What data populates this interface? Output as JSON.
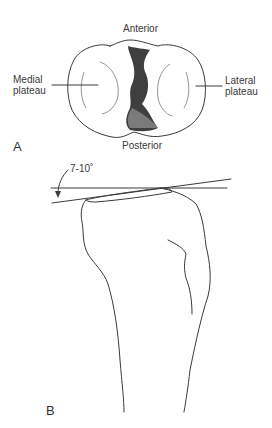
{
  "figure": {
    "panel_a": {
      "letter": "A",
      "labels": {
        "top": "Anterior",
        "bottom": "Posterior",
        "left": "Medial\nplateau",
        "right": "Lateral\nplateau"
      },
      "description": "Superior view of tibial plateau"
    },
    "panel_b": {
      "letter": "B",
      "angle_label": "7-10˚",
      "description": "Lateral view of proximal tibia showing posterior slope"
    }
  }
}
